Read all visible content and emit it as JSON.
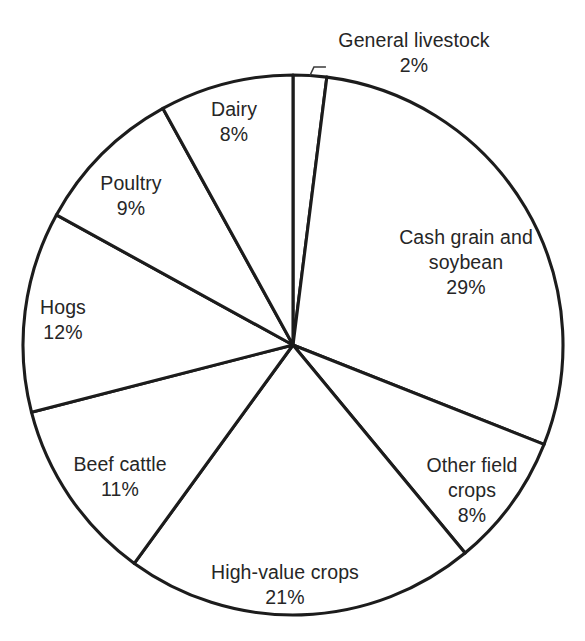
{
  "chart_data": {
    "type": "pie",
    "title": "",
    "subtitle": "",
    "xlabel": "",
    "ylabel": "",
    "legend": "none",
    "grid": false,
    "units": "percent",
    "total": 100,
    "start_angle_deg": 0,
    "direction": "clockwise",
    "categories": [
      "General livestock",
      "Cash grain and soybean",
      "Other field crops",
      "High-value crops",
      "Beef cattle",
      "Hogs",
      "Poultry",
      "Dairy"
    ],
    "values": [
      2,
      29,
      8,
      21,
      11,
      12,
      9,
      8
    ],
    "slices": [
      {
        "name": "General livestock",
        "name_lines": [
          "General livestock"
        ],
        "value": 2,
        "value_label": "2%",
        "label_placement": "outside",
        "has_leader_line": true,
        "label_x": 414,
        "label_y": 53,
        "fill": "#ffffff",
        "stroke": "#1c1c1c"
      },
      {
        "name": "Cash grain and soybean",
        "name_lines": [
          "Cash grain and",
          "soybean"
        ],
        "value": 29,
        "value_label": "29%",
        "label_placement": "inside",
        "has_leader_line": false,
        "label_x": 466,
        "label_y": 262,
        "fill": "#ffffff",
        "stroke": "#1c1c1c"
      },
      {
        "name": "Other field crops",
        "name_lines": [
          "Other field",
          "crops"
        ],
        "value": 8,
        "value_label": "8%",
        "label_placement": "inside",
        "has_leader_line": false,
        "label_x": 472,
        "label_y": 490,
        "fill": "#ffffff",
        "stroke": "#1c1c1c"
      },
      {
        "name": "High-value crops",
        "name_lines": [
          "High-value crops"
        ],
        "value": 21,
        "value_label": "21%",
        "label_placement": "inside",
        "has_leader_line": false,
        "label_x": 285,
        "label_y": 585,
        "fill": "#ffffff",
        "stroke": "#1c1c1c"
      },
      {
        "name": "Beef cattle",
        "name_lines": [
          "Beef cattle"
        ],
        "value": 11,
        "value_label": "11%",
        "label_placement": "inside",
        "has_leader_line": false,
        "label_x": 120,
        "label_y": 477,
        "fill": "#ffffff",
        "stroke": "#1c1c1c"
      },
      {
        "name": "Hogs",
        "name_lines": [
          "Hogs"
        ],
        "value": 12,
        "value_label": "12%",
        "label_placement": "inside",
        "has_leader_line": false,
        "label_x": 63,
        "label_y": 320,
        "fill": "#ffffff",
        "stroke": "#1c1c1c"
      },
      {
        "name": "Poultry",
        "name_lines": [
          "Poultry"
        ],
        "value": 9,
        "value_label": "9%",
        "label_placement": "inside",
        "has_leader_line": false,
        "label_x": 131,
        "label_y": 196,
        "fill": "#ffffff",
        "stroke": "#1c1c1c"
      },
      {
        "name": "Dairy",
        "name_lines": [
          "Dairy"
        ],
        "value": 8,
        "value_label": "8%",
        "label_placement": "inside",
        "has_leader_line": false,
        "label_x": 234,
        "label_y": 122,
        "fill": "#ffffff",
        "stroke": "#1c1c1c"
      }
    ],
    "geometry": {
      "center_x": 293,
      "center_y": 345,
      "radius": 270
    },
    "style": {
      "background": "#ffffff",
      "stroke_color": "#1c1c1c",
      "text_color": "#262626",
      "leader_color": "#3a3a3a"
    }
  }
}
